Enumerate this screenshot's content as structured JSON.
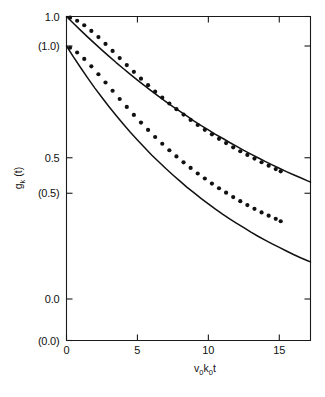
{
  "chart_data": {
    "type": "line",
    "title": "",
    "xlabel": "v0k0t",
    "ylabel": "gk(t)",
    "xlim": [
      0,
      17.2
    ],
    "ylim_primary": [
      0.0,
      1.0
    ],
    "ylim_secondary": [
      0.0,
      1.0
    ],
    "grid": false,
    "legend": "none",
    "x_ticks": [
      {
        "value": 0,
        "label": "0"
      },
      {
        "value": 5,
        "label": "5"
      },
      {
        "value": 10,
        "label": "10"
      },
      {
        "value": 15,
        "label": "15"
      }
    ],
    "y_ticks_primary": [
      {
        "value": 1.0,
        "label": "1.0"
      },
      {
        "value": 0.5,
        "label": "0.5"
      },
      {
        "value": 0.0,
        "label": "0.0"
      }
    ],
    "y_ticks_secondary": [
      {
        "value": 1.0,
        "label": "(1.0)"
      },
      {
        "value": 0.5,
        "label": "(0.5)"
      },
      {
        "value": 0.0,
        "label": "(0.0)"
      }
    ],
    "series": [
      {
        "name": "upper-curve",
        "style": "solid-line",
        "axis": "primary",
        "x": [
          0,
          0.5,
          1,
          1.5,
          2,
          2.5,
          3,
          3.5,
          4,
          4.5,
          5,
          5.5,
          6,
          6.5,
          7,
          7.5,
          8,
          8.5,
          9,
          9.5,
          10,
          10.5,
          11,
          11.5,
          12,
          12.5,
          13,
          13.5,
          14,
          14.5,
          15,
          15.5,
          16,
          16.5,
          17,
          17.2
        ],
        "y": [
          1.0,
          0.975,
          0.951,
          0.927,
          0.904,
          0.881,
          0.859,
          0.837,
          0.816,
          0.795,
          0.775,
          0.755,
          0.736,
          0.717,
          0.699,
          0.681,
          0.664,
          0.647,
          0.63,
          0.614,
          0.599,
          0.583,
          0.569,
          0.554,
          0.54,
          0.526,
          0.513,
          0.5,
          0.487,
          0.475,
          0.463,
          0.451,
          0.44,
          0.429,
          0.418,
          0.414
        ]
      },
      {
        "name": "lower-curve",
        "style": "solid-line",
        "axis": "secondary",
        "x": [
          0,
          0.5,
          1,
          1.5,
          2,
          2.5,
          3,
          3.5,
          4,
          4.5,
          5,
          5.5,
          6,
          6.5,
          7,
          7.5,
          8,
          8.5,
          9,
          9.5,
          10,
          10.5,
          11,
          11.5,
          12,
          12.5,
          13,
          13.5,
          14,
          14.5,
          15,
          15.5,
          16,
          16.5,
          17,
          17.2
        ],
        "y": [
          1.0,
          0.962,
          0.926,
          0.891,
          0.857,
          0.825,
          0.794,
          0.764,
          0.735,
          0.707,
          0.681,
          0.655,
          0.63,
          0.607,
          0.584,
          0.562,
          0.541,
          0.52,
          0.501,
          0.482,
          0.464,
          0.446,
          0.429,
          0.413,
          0.398,
          0.383,
          0.368,
          0.354,
          0.341,
          0.328,
          0.316,
          0.304,
          0.292,
          0.281,
          0.271,
          0.267
        ]
      },
      {
        "name": "upper-dots",
        "style": "dots",
        "axis": "primary",
        "x": [
          0.25,
          0.75,
          1.25,
          1.75,
          2.25,
          2.75,
          3.25,
          3.75,
          4.25,
          4.75,
          5.25,
          5.75,
          6.25,
          6.75,
          7.25,
          7.75,
          8.25,
          8.75,
          9.25,
          9.75,
          10.25,
          10.75,
          11.25,
          11.75,
          12.25,
          12.75,
          13.25,
          13.75,
          14.25,
          14.75,
          15.1
        ],
        "y": [
          0.996,
          0.985,
          0.969,
          0.949,
          0.927,
          0.903,
          0.878,
          0.853,
          0.828,
          0.804,
          0.78,
          0.757,
          0.734,
          0.713,
          0.692,
          0.672,
          0.653,
          0.634,
          0.616,
          0.599,
          0.583,
          0.567,
          0.552,
          0.537,
          0.523,
          0.51,
          0.497,
          0.484,
          0.472,
          0.46,
          0.452
        ]
      },
      {
        "name": "lower-dots",
        "style": "dots",
        "axis": "secondary",
        "x": [
          0.25,
          0.75,
          1.25,
          1.75,
          2.25,
          2.75,
          3.25,
          3.75,
          4.25,
          4.75,
          5.25,
          5.75,
          6.25,
          6.75,
          7.25,
          7.75,
          8.25,
          8.75,
          9.25,
          9.75,
          10.25,
          10.75,
          11.25,
          11.75,
          12.25,
          12.75,
          13.25,
          13.75,
          14.25,
          14.75,
          15.1
        ],
        "y": [
          0.994,
          0.978,
          0.956,
          0.931,
          0.904,
          0.876,
          0.848,
          0.82,
          0.793,
          0.766,
          0.74,
          0.715,
          0.691,
          0.668,
          0.646,
          0.625,
          0.605,
          0.586,
          0.567,
          0.55,
          0.533,
          0.517,
          0.502,
          0.487,
          0.473,
          0.46,
          0.447,
          0.435,
          0.424,
          0.413,
          0.405
        ]
      }
    ]
  },
  "axis_labels": {
    "x_title_main_1": "v",
    "x_title_sub_1": "0",
    "x_title_main_2": "k",
    "x_title_sub_2": "0",
    "x_title_main_3": "t",
    "y_title_main_1": "g",
    "y_title_sub_1": "k",
    "y_title_main_2": "(t)"
  },
  "style": {
    "line_color": "#111111",
    "dot_color": "#111111",
    "axis_color": "#1a1a1a",
    "background": "#ffffff"
  }
}
